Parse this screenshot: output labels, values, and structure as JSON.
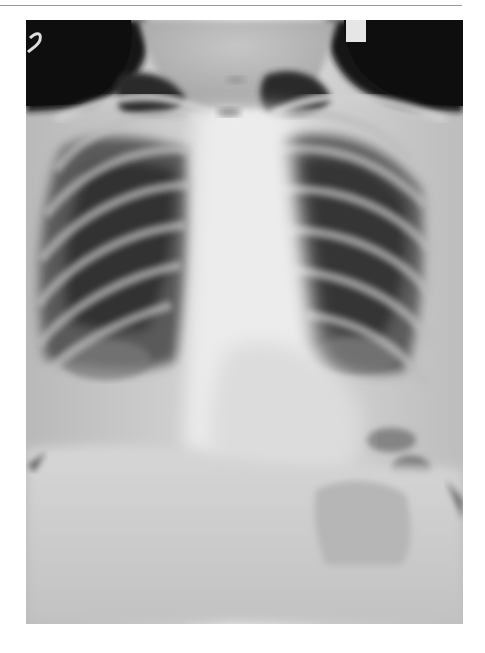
{
  "figure": {
    "type": "photograph",
    "alt": "Posteroanterior chest X-ray showing both lung fields, ribs, clavicles, central mediastinum and diaphragm",
    "palette": {
      "background_dark": "#121212",
      "soft_tissue": "#c9c9c9",
      "mediastinum": "#ececec",
      "lung_dark": "#2e2e2e",
      "lung_mid": "#6a6a6a",
      "rib": "#b8b8b8",
      "marker": "#e8e8e8",
      "frame_rule": "#9a9a9a"
    }
  }
}
